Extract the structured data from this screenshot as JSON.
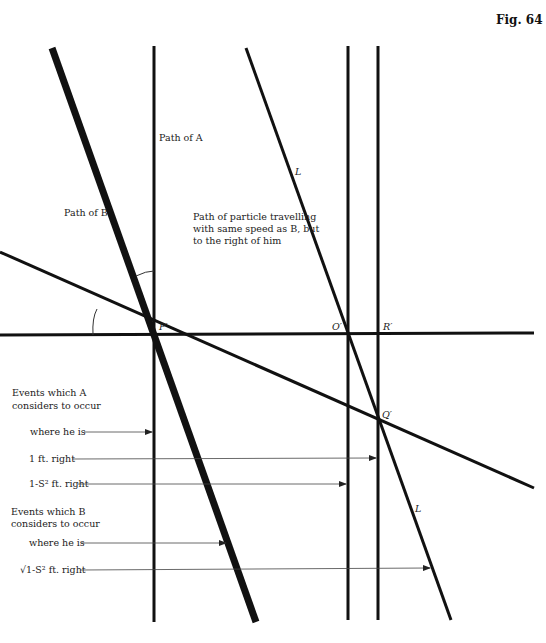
{
  "figure": {
    "title": "Fig. 64",
    "colors": {
      "line": "#111111",
      "guide": "#444444",
      "background": "#ffffff"
    }
  },
  "labels": {
    "path_a": "Path of A",
    "path_b": "Path of B",
    "particle_line1": "Path of particle travelling",
    "particle_line2": "with same speed as B, but",
    "particle_line3": "to the right of him",
    "line_l_top": "L",
    "line_l_bottom": "L"
  },
  "points": {
    "p": "P′",
    "o": "O′",
    "r": "R′",
    "q": "Q′"
  },
  "events_a": {
    "heading_line1": "Events which A",
    "heading_line2": "considers to occur",
    "items": [
      {
        "label": "where  he is"
      },
      {
        "label": "1 ft. right"
      },
      {
        "label": "1-S² ft. right"
      }
    ]
  },
  "events_b": {
    "heading_line1": "Events which B",
    "heading_line2": "considers  to occur",
    "items": [
      {
        "label": "where he is"
      },
      {
        "label": "√1-S² ft. right"
      }
    ]
  }
}
